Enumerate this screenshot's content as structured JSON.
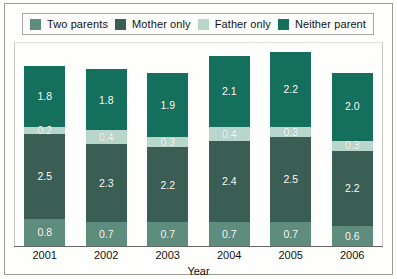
{
  "chart_data": {
    "type": "bar",
    "subtype": "stacked-bar",
    "title": "",
    "xlabel": "Year",
    "ylabel": "",
    "grid": false,
    "ylim": [
      0,
      6
    ],
    "legend_position": "top",
    "categories": [
      "2001",
      "2002",
      "2003",
      "2004",
      "2005",
      "2006"
    ],
    "stack_order_bottom_to_top": [
      "Two parents",
      "Mother only",
      "Father only",
      "Neither parent"
    ],
    "series": [
      {
        "name": "Two parents",
        "color": "#5e8c7d",
        "values": [
          0.8,
          0.7,
          0.7,
          0.7,
          0.7,
          0.6
        ]
      },
      {
        "name": "Mother only",
        "color": "#3a5e53",
        "values": [
          2.5,
          2.3,
          2.2,
          2.4,
          2.5,
          2.2
        ]
      },
      {
        "name": "Father only",
        "color": "#b8d6cc",
        "values": [
          0.2,
          0.4,
          0.3,
          0.4,
          0.3,
          0.3
        ]
      },
      {
        "name": "Neither parent",
        "color": "#14705c",
        "values": [
          1.8,
          1.8,
          1.9,
          2.1,
          2.2,
          2.0
        ]
      }
    ],
    "data_labels": {
      "2001": {
        "Neither parent": "1.8",
        "Father only": "0.2",
        "Mother only": "2.5",
        "Two parents": "0.8"
      },
      "2002": {
        "Neither parent": "1.8",
        "Father only": "0.4",
        "Mother only": "2.3",
        "Two parents": "0.7"
      },
      "2003": {
        "Neither parent": "1.9",
        "Father only": "0.3",
        "Mother only": "2.2",
        "Two parents": "0.7"
      },
      "2004": {
        "Neither parent": "2.1",
        "Father only": "0.4",
        "Mother only": "2.4",
        "Two parents": "0.7"
      },
      "2005": {
        "Neither parent": "2.2",
        "Father only": "0.3",
        "Mother only": "2.5",
        "Two parents": "0.7"
      },
      "2006": {
        "Neither parent": "2.0",
        "Father only": "0.3",
        "Mother only": "2.2",
        "Two parents": "0.6"
      }
    }
  },
  "legend": {
    "items": [
      {
        "label": "Two parents",
        "color": "#5e8c7d"
      },
      {
        "label": "Mother only",
        "color": "#3a5e53"
      },
      {
        "label": "Father only",
        "color": "#b8d6cc"
      },
      {
        "label": "Neither parent",
        "color": "#14705c"
      }
    ]
  },
  "axis": {
    "x_title": "Year",
    "x_ticks": [
      "2001",
      "2002",
      "2003",
      "2004",
      "2005",
      "2006"
    ]
  }
}
